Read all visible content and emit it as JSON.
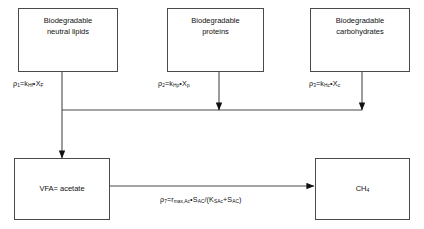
{
  "diagram": {
    "line_color": "#4a4a4a",
    "text_color": "#111111",
    "background": "#ffffff"
  },
  "nodes": {
    "lipids": {
      "label": "Biodegradable\nneutral lipids"
    },
    "proteins": {
      "label": "Biodegradable\nproteins"
    },
    "carbohydrates": {
      "label": "Biodegradable\ncarbohydrates"
    },
    "vfa": {
      "label": "VFA= acetate"
    },
    "methane": {
      "label": "CH"
    },
    "methane_sub": "4"
  },
  "equations": {
    "rho1": {
      "rho": "ρ",
      "rho_sub": "1",
      "eq": "=k",
      "k_sub": "Hf",
      "dot": "•",
      "x": "X",
      "x_sub": "F"
    },
    "rho2": {
      "rho": "ρ",
      "rho_sub": "2",
      "eq": "=k",
      "k_sub": "Hp",
      "dot": "•",
      "x": "X",
      "x_sub": "p"
    },
    "rho3": {
      "rho": "ρ",
      "rho_sub": "3",
      "eq": "=k",
      "k_sub": "Hc",
      "dot": "•",
      "x": "X",
      "x_sub": "c"
    },
    "rho7": {
      "rho": "ρ",
      "rho_sub": "7",
      "eq": "=r",
      "r_sub": "max,Ac",
      "dot": "•",
      "s": "S",
      "s_sub": "AC",
      "slash": "/(K",
      "k_sub": "SAc",
      "plus": "+S",
      "s2_sub": "AC",
      "close": ")"
    }
  }
}
